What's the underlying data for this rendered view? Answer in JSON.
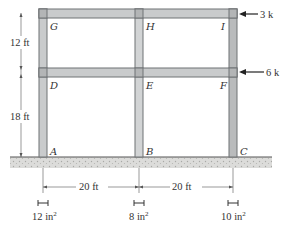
{
  "diagram": {
    "type": "two-story two-bay frame",
    "joints": {
      "A": "A",
      "B": "B",
      "C": "C",
      "D": "D",
      "E": "E",
      "F": "F",
      "G": "G",
      "H": "H",
      "I": "I"
    },
    "loads": [
      {
        "label": "3 k",
        "at": "I",
        "direction": "left"
      },
      {
        "label": "6 k",
        "at": "F",
        "direction": "left"
      }
    ],
    "heights": {
      "upper": "12 ft",
      "lower": "18 ft"
    },
    "spans": {
      "left": "20 ft",
      "right": "20 ft"
    },
    "column_areas": [
      {
        "column": "A",
        "area": "12 in",
        "sup": "2"
      },
      {
        "column": "B",
        "area": "8 in",
        "sup": "2"
      },
      {
        "column": "C",
        "area": "10 in",
        "sup": "2"
      }
    ],
    "colors": {
      "member_fill": "#c9cbcc",
      "member_edge": "#6f7274",
      "ground": "#d8d8d5",
      "text": "#333333"
    }
  }
}
